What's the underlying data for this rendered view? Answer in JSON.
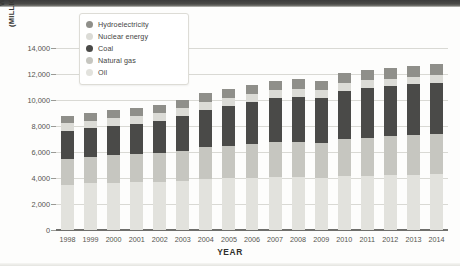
{
  "chart_data": {
    "type": "bar",
    "stacked": true,
    "title": "",
    "xlabel": "YEAR",
    "ylabel": "WORLD ENERGY CONSUMPTION (MILLIONS METRIC TONS OIL EQUIVALENT)",
    "ylabel_line1": "WORLD ENERGY CONSUMPTION",
    "ylabel_line2": "(MILLIONS METRIC TONS OIL EQUIVALENT)",
    "ylim": [
      0,
      14000
    ],
    "ytick_values": [
      0,
      2000,
      4000,
      6000,
      8000,
      10000,
      12000,
      14000
    ],
    "ytick_labels": [
      "0",
      "2,000",
      "4,000",
      "6,000",
      "8,000",
      "10,000",
      "12,000",
      "14,000"
    ],
    "grid": true,
    "grid_axis": "y",
    "legend_position": "top-left-inside",
    "categories": [
      "1998",
      "1999",
      "2000",
      "2001",
      "2002",
      "2003",
      "2004",
      "2005",
      "2006",
      "2007",
      "2008",
      "2009",
      "2010",
      "2011",
      "2012",
      "2013",
      "2014"
    ],
    "series": [
      {
        "name": "Oil",
        "color": "#e2e2dd",
        "values": [
          3500,
          3580,
          3640,
          3660,
          3700,
          3780,
          3930,
          3990,
          4030,
          4090,
          4060,
          4000,
          4120,
          4170,
          4220,
          4260,
          4310
        ]
      },
      {
        "name": "Natural gas",
        "color": "#c6c6c0",
        "values": [
          2000,
          2060,
          2140,
          2170,
          2250,
          2330,
          2420,
          2490,
          2560,
          2670,
          2720,
          2660,
          2860,
          2940,
          3010,
          3070,
          3090
        ]
      },
      {
        "name": "Coal",
        "color": "#4a4a48",
        "values": [
          2150,
          2180,
          2250,
          2350,
          2450,
          2700,
          2900,
          3060,
          3240,
          3400,
          3470,
          3470,
          3680,
          3820,
          3840,
          3900,
          3920
        ]
      },
      {
        "name": "Nuclear energy",
        "color": "#dbdbd6",
        "values": [
          560,
          580,
          590,
          600,
          610,
          610,
          630,
          630,
          640,
          630,
          620,
          610,
          630,
          600,
          560,
          560,
          570
        ]
      },
      {
        "name": "Hydroelectricity",
        "color": "#8f8f8a",
        "values": [
          580,
          590,
          600,
          590,
          600,
          610,
          640,
          670,
          690,
          710,
          730,
          750,
          790,
          800,
          840,
          860,
          880
        ]
      }
    ],
    "totals": [
      8790,
      8990,
      9220,
      9370,
      9610,
      10030,
      10520,
      10840,
      11160,
      11500,
      11600,
      11490,
      12080,
      12330,
      12470,
      12650,
      12770
    ]
  },
  "legend": {
    "items": [
      {
        "label": "Hydroelectricity",
        "color": "#8f8f8a"
      },
      {
        "label": "Nuclear energy",
        "color": "#dbdbd6"
      },
      {
        "label": "Coal",
        "color": "#4a4a48"
      },
      {
        "label": "Natural gas",
        "color": "#c6c6c0"
      },
      {
        "label": "Oil",
        "color": "#e2e2dd"
      }
    ]
  },
  "style": {
    "grid_color": "#d9d9d4",
    "axis_color": "#6f6f6c",
    "tick_text_color": "#55554f",
    "title_color": "#2f2f2c",
    "background": "#fdfdfc"
  }
}
